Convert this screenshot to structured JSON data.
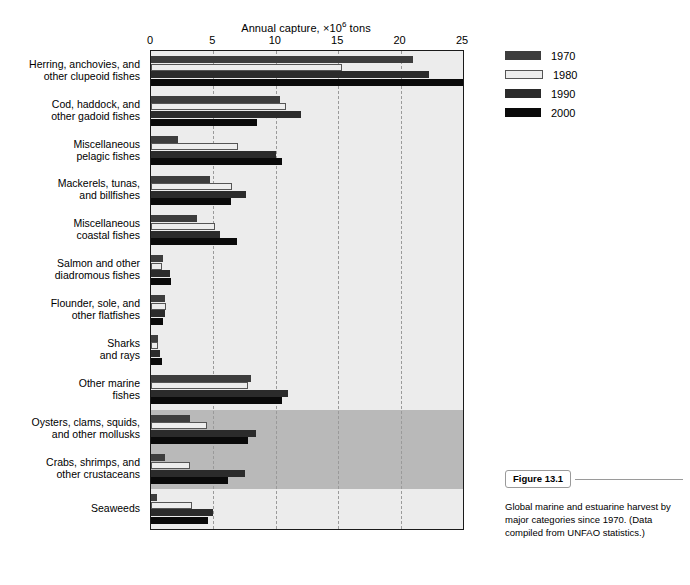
{
  "figure": {
    "tag": "Figure 13.1",
    "caption": "Global marine and estuarine harvest by major categories since 1970. (Data compiled from UNFAO statistics.)"
  },
  "legend": {
    "position": "right",
    "entries": [
      {
        "label": "1970",
        "color": "#3d3d3d"
      },
      {
        "label": "1980",
        "color": "#ededed"
      },
      {
        "label": "1990",
        "color": "#2b2b2b"
      },
      {
        "label": "2000",
        "color": "#0a0a0a"
      }
    ]
  },
  "chart_data": {
    "type": "bar",
    "orientation": "horizontal",
    "title": "",
    "xlabel": "Annual capture, ×10⁶ tons",
    "ylabel": "",
    "xlim": [
      0,
      25
    ],
    "xticks": [
      0,
      5,
      10,
      15,
      20,
      25
    ],
    "xticklabels": [
      "0",
      "5",
      "10",
      "15",
      "20",
      "25"
    ],
    "grid": "vertical dashed gridlines at x = 5, 10, 15, 20",
    "legend_position": "right, outside plot",
    "categories": [
      "Herring, anchovies, and\nother clupeoid fishes",
      "Cod, haddock, and\nother gadoid fishes",
      "Miscellaneous\npelagic fishes",
      "Mackerels, tunas,\nand billfishes",
      "Miscellaneous\ncoastal fishes",
      "Salmon and other\ndiadromous fishes",
      "Flounder, sole, and\nother flatfishes",
      "Sharks\nand rays",
      "Other marine\nfishes",
      "Oysters, clams, squids,\nand other mollusks",
      "Crabs, shrimps, and\nother crustaceans",
      "Seaweeds"
    ],
    "series": [
      {
        "name": "1970",
        "color": "#3d3d3d",
        "values": [
          21.0,
          10.3,
          2.2,
          4.7,
          3.7,
          1.0,
          1.1,
          0.6,
          8.0,
          3.1,
          1.1,
          0.5
        ]
      },
      {
        "name": "1980",
        "color": "#ededed",
        "values": [
          15.3,
          10.8,
          7.0,
          6.5,
          5.1,
          0.9,
          1.2,
          0.6,
          7.8,
          4.5,
          3.1,
          3.3
        ]
      },
      {
        "name": "1990",
        "color": "#2b2b2b",
        "values": [
          22.3,
          12.0,
          10.0,
          7.6,
          5.5,
          1.5,
          1.1,
          0.7,
          11.0,
          8.4,
          7.5,
          5.0
        ]
      },
      {
        "name": "2000",
        "color": "#0a0a0a",
        "values": [
          25.0,
          8.5,
          10.5,
          6.4,
          6.9,
          1.6,
          1.0,
          0.9,
          10.5,
          7.8,
          6.2,
          4.6
        ]
      }
    ],
    "shaded_bands": [
      {
        "from_category_index": 9,
        "to_category_index": 10,
        "color": "#b9b9b9"
      }
    ]
  }
}
